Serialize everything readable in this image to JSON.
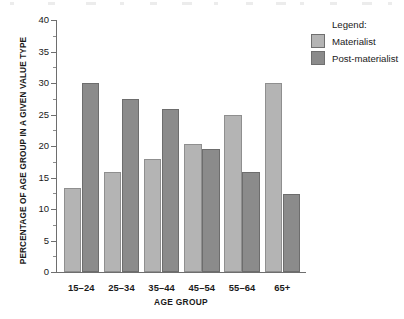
{
  "chart_data": {
    "type": "bar",
    "title": "",
    "xlabel": "AGE GROUP",
    "ylabel": "PERCENTAGE OF AGE GROUP IN A GIVEN VALUE TYPE",
    "categories": [
      "15–24",
      "25–34",
      "35–44",
      "45–54",
      "55–64",
      "65+"
    ],
    "series": [
      {
        "name": "Materialist",
        "color": "#b4b4b4",
        "values": [
          13.3,
          15.8,
          17.9,
          20.3,
          24.9,
          30.0
        ]
      },
      {
        "name": "Post-materialist",
        "color": "#8b8b8b",
        "values": [
          30.0,
          27.5,
          25.8,
          19.6,
          15.8,
          12.4
        ]
      }
    ],
    "ylim": [
      0,
      40
    ],
    "y_ticks": [
      0,
      5,
      10,
      15,
      20,
      25,
      30,
      35,
      40
    ],
    "y_tick_labels": [
      "0",
      "5",
      "10",
      "15",
      "20",
      "25",
      "30",
      "35",
      "40"
    ],
    "y_minor_ticks": [
      2.5,
      7.5,
      12.5,
      17.5,
      22.5,
      27.5,
      32.5,
      37.5
    ],
    "grid": false,
    "legend_position": "top-right"
  },
  "legend": {
    "title": "Legend:",
    "entries": [
      {
        "label": "Materialist",
        "color": "#b4b4b4"
      },
      {
        "label": "Post-materialist",
        "color": "#8b8b8b"
      }
    ]
  },
  "axes": {
    "y_title": "PERCENTAGE OF AGE GROUP IN A GIVEN VALUE TYPE",
    "x_title": "AGE GROUP"
  },
  "colors": {
    "materialist": "#b4b4b4",
    "post_materialist": "#8b8b8b",
    "axis": "#6e6e6e",
    "text": "#1a1a1a",
    "background": "#ffffff"
  }
}
